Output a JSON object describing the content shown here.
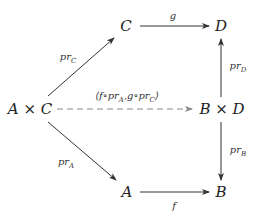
{
  "diagram": {
    "type": "commutative-diagram",
    "nodes": {
      "AxC": "A × C",
      "C": "C",
      "D": "D",
      "BxD": "B × D",
      "A": "A",
      "B": "B"
    },
    "edges": [
      {
        "from": "C",
        "to": "D",
        "label": "g",
        "style": "solid"
      },
      {
        "from": "AxC",
        "to": "C",
        "label": "pr_C",
        "style": "solid"
      },
      {
        "from": "BxD",
        "to": "D",
        "label": "pr_D",
        "style": "solid"
      },
      {
        "from": "AxC",
        "to": "BxD",
        "label": "⟨f∘pr_A, g∘pr_C⟩",
        "style": "dashed"
      },
      {
        "from": "AxC",
        "to": "A",
        "label": "pr_A",
        "style": "solid"
      },
      {
        "from": "BxD",
        "to": "B",
        "label": "pr_B",
        "style": "solid"
      },
      {
        "from": "A",
        "to": "B",
        "label": "f",
        "style": "solid"
      }
    ],
    "labels": {
      "g": "g",
      "f": "f",
      "pr": "pr",
      "sub_C": "C",
      "sub_D": "D",
      "sub_A": "A",
      "sub_B": "B",
      "pair_open": "⟨",
      "pair_f": "f∘pr",
      "pair_sep": ",g∘pr",
      "pair_close": "⟩"
    },
    "colors": {
      "stroke": "#333333",
      "dashed": "#888888",
      "text": "#222222"
    }
  }
}
